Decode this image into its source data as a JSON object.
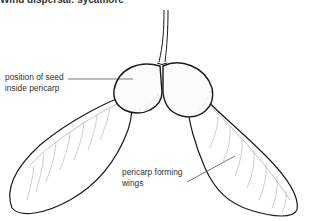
{
  "caption": "Wind dispersal: sycamore",
  "labels": {
    "seed_line1": "position of seed",
    "seed_line2": "inside pericarp",
    "wing_line1": "pericarp forming",
    "wing_line2": "wings"
  },
  "colors": {
    "outline": "#1a1a1a",
    "leader_line": "#444444",
    "vein": "#8a8a8a",
    "stipple": "#b0b0b0",
    "background": "#ffffff"
  }
}
